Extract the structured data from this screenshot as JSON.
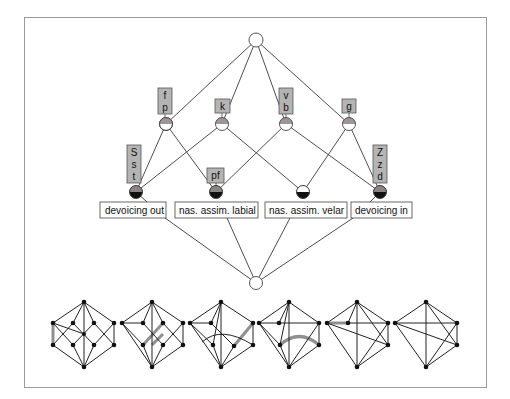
{
  "diagram": {
    "type": "concept-lattice",
    "top_node": {
      "x": 256,
      "y": 40
    },
    "bottom_node": {
      "x": 256,
      "y": 283
    },
    "attribute_nodes": [
      {
        "id": "fp",
        "x": 166,
        "y": 124,
        "labels": [
          "f",
          "p"
        ]
      },
      {
        "id": "k",
        "x": 222,
        "y": 124,
        "labels": [
          "k"
        ]
      },
      {
        "id": "vb",
        "x": 286,
        "y": 124,
        "labels": [
          "v",
          "b"
        ]
      },
      {
        "id": "g",
        "x": 349,
        "y": 124,
        "labels": [
          "g"
        ]
      }
    ],
    "object_nodes": [
      {
        "id": "devoicing_out",
        "x": 136,
        "y": 192,
        "attr_labels": [
          "S",
          "s",
          "t"
        ],
        "name": "devoicing out"
      },
      {
        "id": "nas_labial",
        "x": 216,
        "y": 192,
        "attr_labels": [
          "pf"
        ],
        "name": "nas. assim. labial"
      },
      {
        "id": "nas_velar",
        "x": 303,
        "y": 192,
        "attr_labels": [],
        "name": "nas. assim. velar"
      },
      {
        "id": "devoicing_in",
        "x": 380,
        "y": 192,
        "attr_labels": [
          "Z",
          "z",
          "d"
        ],
        "name": "devoicing in"
      }
    ],
    "colors": {
      "label_box_fill": "#b4b4b4",
      "node_top_half": "#8c8484",
      "node_bottom_half": "#111111",
      "edge": "#3a3a3a",
      "frame": "#9a9a9a",
      "highlight_edge": "#909090"
    },
    "small_graphs_count": 6
  }
}
